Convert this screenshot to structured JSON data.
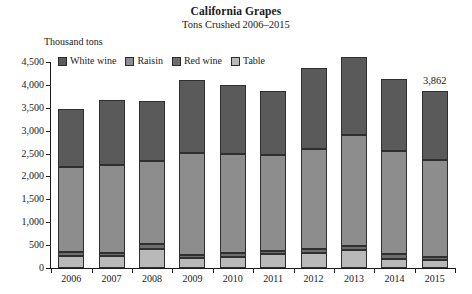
{
  "chart_data": {
    "type": "bar",
    "stacked": true,
    "title": "California Grapes",
    "subtitle": "Tons Crushed 2006–2015",
    "ylabel": "Thousand tons",
    "xlabel": "",
    "ylim": [
      0,
      4500
    ],
    "ytick_values": [
      0,
      500,
      1000,
      1500,
      2000,
      2500,
      3000,
      3500,
      4000,
      4500
    ],
    "ytick_labels": [
      "0",
      "500",
      "1,000",
      "1,500",
      "2,000",
      "2,500",
      "3,000",
      "3,500",
      "4,000",
      "4,500"
    ],
    "grid": false,
    "legend_position": "top-left",
    "categories": [
      "2006",
      "2007",
      "2008",
      "2009",
      "2010",
      "2011",
      "2012",
      "2013",
      "2014",
      "2015"
    ],
    "stack_order_bottom_to_top": [
      "Table",
      "Red wine",
      "Raisin",
      "White wine"
    ],
    "series": [
      {
        "name": "Table",
        "color": "#b9b9b9",
        "values": [
          270,
          255,
          420,
          210,
          240,
          300,
          330,
          390,
          200,
          170
        ]
      },
      {
        "name": "Red wine",
        "color": "#6e6e6e",
        "values": [
          70,
          70,
          110,
          70,
          80,
          80,
          90,
          90,
          110,
          80
        ]
      },
      {
        "name": "Raisin",
        "color": "#8d8d8d",
        "values": [
          1860,
          1930,
          1810,
          2230,
          2170,
          2080,
          2190,
          2420,
          2250,
          2120
        ]
      },
      {
        "name": "White wine",
        "color": "#5a5a5a",
        "values": [
          1280,
          1415,
          1310,
          1600,
          1510,
          1410,
          1760,
          1720,
          1560,
          1492
        ]
      }
    ],
    "totals": [
      3480,
      3670,
      3650,
      4110,
      4000,
      3870,
      4370,
      4620,
      4120,
      3862
    ],
    "annotations": [
      {
        "category": "2015",
        "text": "3,862",
        "value": 3862
      }
    ]
  }
}
